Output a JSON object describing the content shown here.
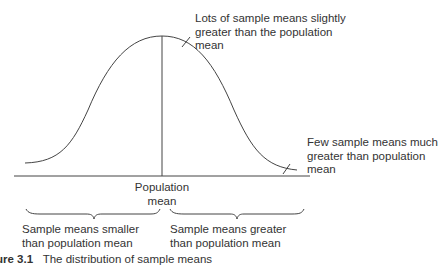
{
  "diagram": {
    "type": "normal-distribution-annotation",
    "annotations": {
      "peak_right": [
        "Lots of sample means slightly",
        "greater than the population",
        "mean"
      ],
      "right_tail": [
        "Few sample means much",
        "greater than population",
        "mean"
      ],
      "center": [
        "Population",
        "mean"
      ],
      "left_brace": [
        "Sample means smaller",
        "than population mean"
      ],
      "right_brace": [
        "Sample means greater",
        "than population mean"
      ]
    },
    "caption": {
      "number": "ure 3.1",
      "text": "The distribution of sample means"
    },
    "colors": {
      "line": "#444444",
      "text": "#333333",
      "background": "#ffffff"
    }
  }
}
